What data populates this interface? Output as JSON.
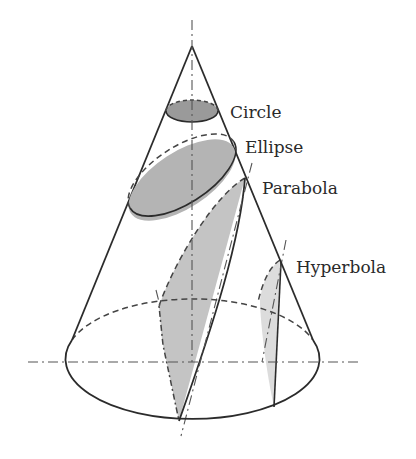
{
  "diagram": {
    "type": "conic-sections",
    "labels": {
      "circle": "Circle",
      "ellipse": "Ellipse",
      "parabola": "Parabola",
      "hyperbola": "Hyperbola"
    },
    "colors": {
      "stroke": "#2b2b2b",
      "circle_fill": "#9a9a9a",
      "ellipse_fill": "#b4b4b4",
      "parabola_fill": "#c4c4c4",
      "hyperbola_fill": "#dcdcdc",
      "background": "#ffffff"
    }
  }
}
